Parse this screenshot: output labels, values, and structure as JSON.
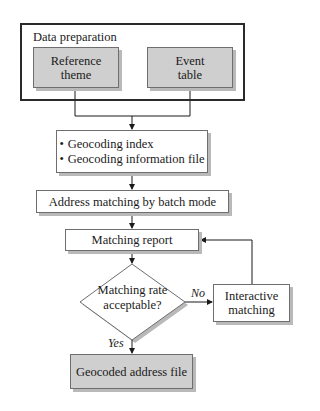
{
  "diagram": {
    "type": "flowchart",
    "data_preparation": {
      "title": "Data preparation",
      "reference_box": {
        "line1": "Reference",
        "line2": "theme"
      },
      "event_box": {
        "line1": "Event",
        "line2": "table"
      }
    },
    "geocoding_box": {
      "items": [
        "Geocoding index",
        "Geocoding information file"
      ]
    },
    "address_box": {
      "label": "Address matching by batch mode"
    },
    "report_box": {
      "label": "Matching report"
    },
    "decision": {
      "line1": "Matching rate",
      "line2": "acceptable?"
    },
    "interactive_box": {
      "line1": "Interactive",
      "line2": "matching"
    },
    "output_box": {
      "label": "Geocoded address file"
    },
    "edge_labels": {
      "no": "No",
      "yes": "Yes"
    },
    "colors": {
      "gray_fill": "#cfcfcf",
      "border": "#6e6e6e",
      "shadow": "#b9b9b9"
    }
  }
}
